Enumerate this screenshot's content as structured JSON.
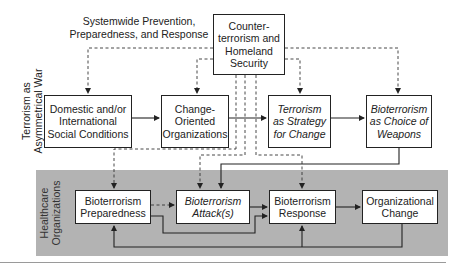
{
  "diagram": {
    "top_label": "Systemwide Prevention,\nPreparedness, and Response",
    "side_label_top": "Terrorism as\nAsymmetrical War",
    "side_label_bottom": "Healthcare\nOrganizations",
    "nodes": {
      "counterterrorism": "Counter-\nterrorism and\nHomeland\nSecurity",
      "social_conditions": "Domestic and/or\nInternational\nSocial Conditions",
      "change_orgs": "Change-\nOriented\nOrganizations",
      "terrorism_strategy": "Terrorism\nas Strategy\nfor Change",
      "bioterrorism_choice": "Bioterrorism\nas Choice of\nWeapons",
      "preparedness": "Bioterrorism\nPreparedness",
      "attack": "Bioterrorism\nAttack(s)",
      "response": "Bioterrorism\nResponse",
      "org_change": "Organizational\nChange"
    },
    "edges": [
      {
        "from": "counterterrorism",
        "to": "social_conditions",
        "style": "dashed"
      },
      {
        "from": "counterterrorism",
        "to": "change_orgs",
        "style": "dashed"
      },
      {
        "from": "counterterrorism",
        "to": "terrorism_strategy",
        "style": "dashed"
      },
      {
        "from": "counterterrorism",
        "to": "bioterrorism_choice",
        "style": "dashed"
      },
      {
        "from": "counterterrorism",
        "to": "preparedness",
        "style": "dashed"
      },
      {
        "from": "counterterrorism",
        "to": "attack",
        "style": "dashed"
      },
      {
        "from": "counterterrorism",
        "to": "response",
        "style": "dashed"
      },
      {
        "from": "social_conditions",
        "to": "change_orgs",
        "style": "solid"
      },
      {
        "from": "change_orgs",
        "to": "terrorism_strategy",
        "style": "solid"
      },
      {
        "from": "terrorism_strategy",
        "to": "bioterrorism_choice",
        "style": "solid"
      },
      {
        "from": "bioterrorism_choice",
        "to": "attack",
        "style": "solid"
      },
      {
        "from": "preparedness",
        "to": "attack",
        "style": "dashed"
      },
      {
        "from": "preparedness",
        "to": "response",
        "style": "solid"
      },
      {
        "from": "attack",
        "to": "response",
        "style": "solid"
      },
      {
        "from": "response",
        "to": "org_change",
        "style": "solid"
      },
      {
        "from": "org_change",
        "to": "preparedness",
        "style": "solid"
      },
      {
        "from": "org_change",
        "to": "response",
        "style": "solid"
      }
    ],
    "colors": {
      "band": "#b3b3b3",
      "line": "#222222",
      "box_fill": "#ffffff"
    }
  }
}
